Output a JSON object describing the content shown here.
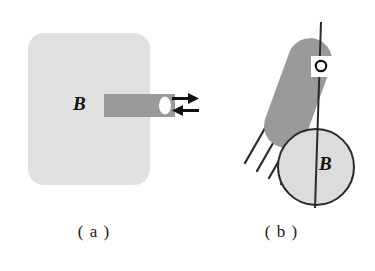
{
  "figure": {
    "width": 375,
    "height": 271,
    "background": "#ffffff"
  },
  "panels": [
    {
      "id": "a",
      "caption": "( a )",
      "b_label": "B",
      "shapes": {
        "rounded_body": {
          "name": "light-gray-rounded-rect",
          "fill": "#e0e0e0",
          "x": 28,
          "y": 33,
          "width": 122,
          "height": 152,
          "radius": 16
        },
        "bar": {
          "name": "gray-bar",
          "fill": "#9a9a9a",
          "x": 104,
          "y": 94,
          "width": 71,
          "height": 23
        },
        "hole": {
          "name": "white-ellipse-hole",
          "fill": "#ffffff",
          "cx": 165,
          "cy": 105,
          "rx": 6,
          "ry": 9
        }
      }
    },
    {
      "id": "b",
      "caption": "( b )",
      "b_label": "B",
      "shapes": {
        "axis_line": {
          "name": "vertical-axis-line",
          "stroke": "#2a2a2a",
          "x1": 133,
          "y1": 22,
          "x2": 127,
          "y2": 208,
          "width": 2
        },
        "rod": {
          "name": "tilted-gray-rod",
          "fill": "#9a9a9a",
          "angle_deg": 20,
          "x": 88,
          "y": 36,
          "width": 44,
          "height": 114,
          "radius": 22
        },
        "pivot_hole": {
          "name": "pivot-hole-circle",
          "fill": "#ffffff",
          "stroke": "#111111",
          "cx": 133,
          "cy": 66,
          "r": 5
        },
        "pivot_patch": {
          "name": "white-patch",
          "fill": "#ffffff",
          "x": 124,
          "y": 56,
          "width": 22,
          "height": 21
        },
        "magnet_circle": {
          "name": "magnet-circle",
          "fill": "#dcdcdc",
          "stroke": "#2a2a2a",
          "cx": 128,
          "cy": 167,
          "r": 38
        },
        "hatch_lines": {
          "name": "hatching-lines",
          "stroke": "#2a2a2a",
          "count": 5,
          "angle_deg": 60
        }
      }
    }
  ],
  "arrows": {
    "name": "double-arrow-pair",
    "color": "#111111",
    "top": {
      "label": "right-arrow",
      "direction": "right",
      "x": 172,
      "y": 98,
      "length": 22
    },
    "bottom": {
      "label": "left-arrow",
      "direction": "left",
      "x": 172,
      "y": 110,
      "length": 22
    }
  },
  "colors": {
    "body_gray": "#e0e0e0",
    "bar_gray": "#9a9a9a",
    "circle_gray": "#dcdcdc",
    "ink": "#1a1a1a",
    "white": "#ffffff"
  }
}
